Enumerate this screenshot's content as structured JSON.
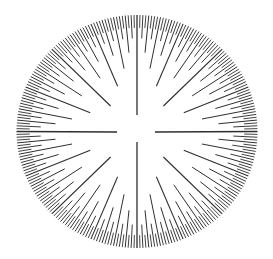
{
  "diagram": {
    "type": "radial-tick-dial",
    "canvas": {
      "width": 273,
      "height": 259
    },
    "center": {
      "x": 137,
      "y": 131.5
    },
    "outer_radius": {
      "x": 120.5,
      "y": 116.5
    },
    "tick_count": 256,
    "line_color": "#2f2f2f",
    "background_color": "#ffffff",
    "tick_levels": [
      {
        "divisor": 64,
        "angle_step_deg": 90,
        "inner_radius_frac": 0.15,
        "stroke_width": 1.3
      },
      {
        "divisor": 32,
        "angle_step_deg": 45,
        "inner_radius_frac": 0.31,
        "stroke_width": 1.2
      },
      {
        "divisor": 16,
        "angle_step_deg": 22.5,
        "inner_radius_frac": 0.42,
        "stroke_width": 1.1
      },
      {
        "divisor": 8,
        "angle_step_deg": 11.25,
        "inner_radius_frac": 0.55,
        "stroke_width": 1.0
      },
      {
        "divisor": 4,
        "angle_step_deg": 5.625,
        "inner_radius_frac": 0.68,
        "stroke_width": 1.0
      },
      {
        "divisor": 2,
        "angle_step_deg": 2.8125,
        "inner_radius_frac": 0.8,
        "stroke_width": 0.95
      },
      {
        "divisor": 1,
        "angle_step_deg": 1.40625,
        "inner_radius_frac": 0.89,
        "stroke_width": 0.9
      }
    ],
    "cardinal_lines": {
      "vertical_x": 137,
      "top_inner_end_y": 115,
      "bottom_inner_start_y": 142,
      "horizontal_y": 132,
      "left_inner_end_x": 117,
      "right_inner_start_x": 155
    }
  }
}
